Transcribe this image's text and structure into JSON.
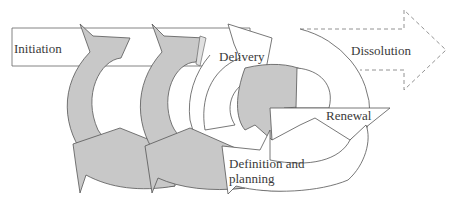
{
  "diagram": {
    "colors": {
      "grey_fill": "#c8c8c8",
      "stroke": "#555555",
      "white_fill": "#ffffff",
      "dashed_stroke": "#666666",
      "text": "#3a3a3a"
    },
    "stages": [
      {
        "id": "initiation",
        "label": "Initiation",
        "style": "solid-rectangle-arrow"
      },
      {
        "id": "cycle-1",
        "label": "",
        "style": "grey-circular-arrow"
      },
      {
        "id": "cycle-2",
        "label": "",
        "style": "grey-circular-arrow"
      },
      {
        "id": "delivery",
        "label": "Delivery",
        "style": "white-circular-arrow"
      },
      {
        "id": "renewal",
        "label": "Renewal",
        "style": "white-circular-arrow"
      },
      {
        "id": "definition",
        "label": "Definition and planning",
        "style": "white-circular-arrow"
      },
      {
        "id": "dissolution",
        "label": "Dissolution",
        "style": "dashed-arrow"
      }
    ],
    "labels": {
      "initiation": "Initiation",
      "delivery": "Delivery",
      "dissolution": "Dissolution",
      "renewal": "Renewal",
      "definition": "Definition and planning"
    }
  }
}
